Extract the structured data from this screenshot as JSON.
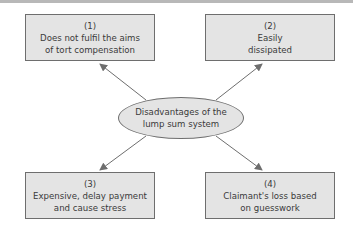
{
  "diagram": {
    "center": {
      "line1": "Disadvantages of the",
      "line2": "lump sum system"
    },
    "boxes": [
      {
        "number": "(1)",
        "line1": "Does not fulfil the aims",
        "line2": "of tort compensation"
      },
      {
        "number": "(2)",
        "line1": "Easily",
        "line2": "dissipated"
      },
      {
        "number": "(3)",
        "line1": "Expensive, delay payment",
        "line2": "and cause stress"
      },
      {
        "number": "(4)",
        "line1": "Claimant's loss based",
        "line2": "on guesswork"
      }
    ],
    "colors": {
      "fill": "#e4e4e4",
      "stroke": "#6e6e6e",
      "text": "#3a3a3a"
    }
  }
}
